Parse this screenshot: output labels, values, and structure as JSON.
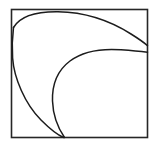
{
  "figure": {
    "background_color": "#ffffff",
    "ink_color": "#1c1c1c",
    "frame": {
      "name": "square-border",
      "x": 11.5,
      "y": 9.5,
      "width": 136,
      "height": 128,
      "stroke_color": "#262626",
      "stroke_width": 1.6
    },
    "curves": [
      {
        "name": "outer-arc",
        "description": "large arc from left border near top, bulging up and right, descending to right border",
        "stroke_color": "#1c1c1c",
        "stroke_width": 1.5,
        "path": "M 13.5 27.5 C 20 16.5 36 11.5 58 11.8 C 86 12.2 112 22 131 34 C 139 39 144.5 43 147.5 45.6"
      },
      {
        "name": "outer-arc-lower-tail",
        "description": "continuation of the large arc down the left side to the bottom meeting point",
        "stroke_color": "#1c1c1c",
        "stroke_width": 1.5,
        "path": "M 13.5 27.5 C 12.2 38 11.9 48 12.6 58 C 14 78 25 104 41 120 C 51 130 59 135.5 63.5 137.5"
      },
      {
        "name": "inner-arc",
        "description": "smaller arc from bottom meeting point rising up and right, flattening into the right border",
        "stroke_color": "#1c1c1c",
        "stroke_width": 1.5,
        "path": "M 64.5 137.5 C 58 128 53 115 52.5 101 C 52 84 58 70 70 61 C 84 50.5 103 48.5 121 49.8 C 134 50.7 142.5 51.6 147.5 52.2"
      }
    ],
    "intersections": [
      {
        "name": "bottom-vertex",
        "x": 64,
        "y": 137.5
      },
      {
        "name": "right-edge-upper",
        "x": 147.5,
        "y": 45.6
      },
      {
        "name": "right-edge-lower",
        "x": 147.5,
        "y": 52.2
      },
      {
        "name": "left-edge-top",
        "x": 13.5,
        "y": 27.5
      }
    ]
  }
}
